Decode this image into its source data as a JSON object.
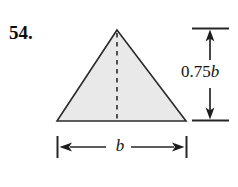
{
  "figure": {
    "problem_number": "54.",
    "shape": "triangle",
    "fill_color": "#e9e9e9",
    "stroke_color": "#2b2b2b",
    "background_color": "#ffffff",
    "centerline_style": "dashed",
    "dimensions": {
      "height_label_prefix": "0.75",
      "height_label_variable": "b",
      "base_label": "b"
    },
    "geometry": {
      "apex_x": 117,
      "apex_y": 30,
      "base_left_x": 57,
      "base_right_x": 186,
      "base_y": 121,
      "centerline_x": 117,
      "vertical_dim_x": 210,
      "vertical_dim_top_y": 28,
      "vertical_dim_bottom_y": 120,
      "extension_line_left_x": 192,
      "extension_line_right_x": 229,
      "horizontal_dim_y": 147,
      "horizontal_tick_top_y": 136,
      "horizontal_tick_bottom_y": 158
    }
  }
}
